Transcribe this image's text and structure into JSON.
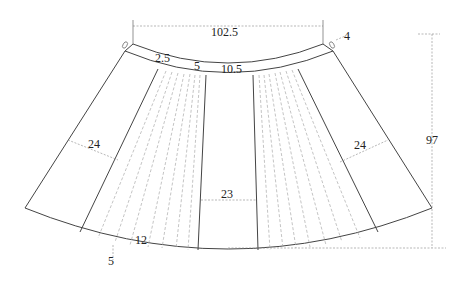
{
  "diagram": {
    "type": "skirt-pattern",
    "labels": {
      "waist_width": "102.5",
      "waistband_tab": "4",
      "waistband_overlap": "2.5",
      "pleat_offset": "5",
      "center_top": "10.5",
      "left_panel_width": "24",
      "right_panel_width": "24",
      "center_panel_width": "23",
      "hem_segment": "12",
      "hem_offset": "5",
      "skirt_length": "97"
    },
    "colors": {
      "outline": "#444444",
      "pleat_lines": "#aaaaaa",
      "dimension_lines": "#888888",
      "text": "#222222"
    }
  }
}
